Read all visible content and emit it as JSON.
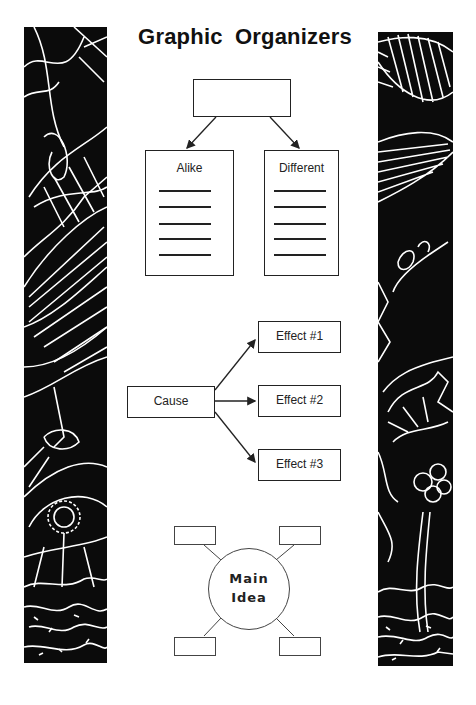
{
  "page": {
    "title": "Graphic Organizers"
  },
  "compare_contrast": {
    "top_box_label": "",
    "columns": [
      {
        "label": "Alike",
        "line_count": 5
      },
      {
        "label": "Different",
        "line_count": 5
      }
    ]
  },
  "cause_effect": {
    "cause_label": "Cause",
    "effects": [
      {
        "label": "Effect #1"
      },
      {
        "label": "Effect #2"
      },
      {
        "label": "Effect #3"
      }
    ]
  },
  "main_idea": {
    "line1": "Main",
    "line2": "Idea",
    "satellite_count": 4
  },
  "decorations": {
    "left_panel": "botanical-leaf-border-icon",
    "right_panel": "botanical-leaf-border-icon",
    "panel_color": "#0b0b0b",
    "line_color": "#ffffff"
  }
}
